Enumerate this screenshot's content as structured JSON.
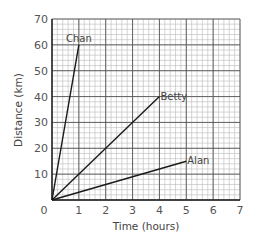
{
  "chart_data": {
    "type": "line",
    "title": "",
    "xlabel": "Time (hours)",
    "ylabel": "Distance (km)",
    "xlim": [
      0,
      7
    ],
    "ylim": [
      0,
      70
    ],
    "x_ticks": [
      "0",
      "1",
      "2",
      "3",
      "4",
      "5",
      "6",
      "7"
    ],
    "y_ticks": [
      "0",
      "10",
      "20",
      "30",
      "40",
      "50",
      "60",
      "70"
    ],
    "x_major_step": 1,
    "x_minor_step": 0.2,
    "y_major_step": 10,
    "y_minor_step": 2,
    "grid": true,
    "legend": "inline-labels",
    "series": [
      {
        "name": "Chan",
        "x": [
          0,
          1
        ],
        "y": [
          0,
          60
        ]
      },
      {
        "name": "Betty",
        "x": [
          0,
          4
        ],
        "y": [
          0,
          40
        ]
      },
      {
        "name": "Alan",
        "x": [
          0,
          5
        ],
        "y": [
          0,
          15
        ]
      }
    ],
    "colors": {
      "line": "#1a1a1a",
      "major_grid": "#555555",
      "minor_grid": "#bbbbbb",
      "axis": "#222222"
    }
  }
}
